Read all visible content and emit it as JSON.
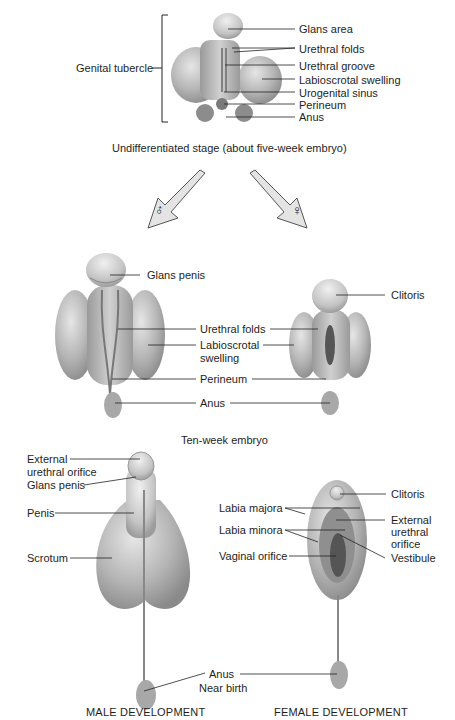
{
  "stage1": {
    "caption": "Undifferentiated stage (about five-week embryo)",
    "bracket_label": "Genital tubercle",
    "labels": [
      "Glans area",
      "Urethral folds",
      "Urethral groove",
      "Labioscrotal swelling",
      "Urogenital sinus",
      "Perineum",
      "Anus"
    ]
  },
  "arrows": {
    "male_symbol": "♂",
    "female_symbol": "♀"
  },
  "stage2": {
    "caption": "Ten-week embryo",
    "male_labels": {
      "glans": "Glans penis"
    },
    "female_labels": {
      "clitoris": "Clitoris"
    },
    "shared_labels": {
      "urethral_folds": "Urethral folds",
      "labioscrotal_1": "Labioscrotal",
      "labioscrotal_2": "swelling",
      "perineum": "Perineum",
      "anus": "Anus"
    }
  },
  "stage3": {
    "caption": "Near birth",
    "male_labels": {
      "ext_urethral_1": "External",
      "ext_urethral_2": "urethral orifice",
      "glans": "Glans penis",
      "penis": "Penis",
      "scrotum": "Scrotum"
    },
    "female_labels": {
      "labia_majora": "Labia majora",
      "labia_minora": "Labia minora",
      "vaginal_orifice": "Vaginal orifice",
      "clitoris": "Clitoris",
      "ext_urethral_1": "External",
      "ext_urethral_2": "urethral",
      "ext_urethral_3": "orifice",
      "vestibule": "Vestibule"
    },
    "anus": "Anus"
  },
  "footer": {
    "male": "MALE DEVELOPMENT",
    "female": "FEMALE DEVELOPMENT"
  }
}
